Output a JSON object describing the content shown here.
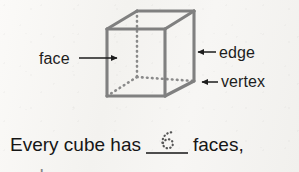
{
  "page": {
    "kind": "math-worksheet-scan",
    "background_color": "#f6f5f3",
    "ink_color": "#1d1d1d",
    "line_color": "#808080"
  },
  "figure": {
    "name": "cube-diagram",
    "shape": "cube",
    "solid_edge_color": "#808080",
    "hidden_edge_color": "#8c8c8c",
    "hidden_edge_style": "dotted",
    "vertices": {
      "front_top_left": [
        107,
        29
      ],
      "front_top_right": [
        165,
        29
      ],
      "front_bottom_right": [
        165,
        96
      ],
      "front_bottom_left": [
        107,
        96
      ],
      "back_top_left": [
        137,
        11
      ],
      "back_top_right": [
        194,
        11
      ],
      "back_bottom_right": [
        194,
        81
      ],
      "back_bottom_left": [
        137,
        77
      ]
    }
  },
  "callouts": [
    {
      "id": "face",
      "label": "face",
      "arrow_direction": "right",
      "arrow_tail": [
        79,
        58
      ],
      "arrow_tip": [
        122,
        58
      ]
    },
    {
      "id": "edge",
      "label": "edge",
      "arrow_direction": "left",
      "arrow_tail": [
        216,
        52
      ],
      "arrow_tip": [
        193,
        52
      ]
    },
    {
      "id": "vertex",
      "label": "vertex",
      "arrow_direction": "left",
      "arrow_tail": [
        218,
        82
      ],
      "arrow_tip": [
        197,
        82
      ]
    }
  ],
  "sentence": {
    "lead": "Every cube has",
    "blank_answer": "6",
    "blank_answer_style": "dotted-trace",
    "tail": "faces,"
  },
  "next_line_peek": {
    "text": "and                              ,"
  }
}
